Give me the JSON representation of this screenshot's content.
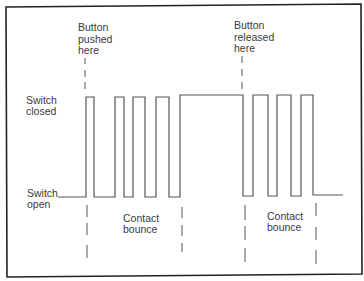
{
  "diagram": {
    "labels": {
      "button_pushed": [
        "Button",
        "pushed",
        "here"
      ],
      "button_released": [
        "Button",
        "released",
        "here"
      ],
      "switch_closed": [
        "Switch",
        "closed"
      ],
      "switch_open": [
        "Switch",
        "open"
      ],
      "contact_bounce_left": [
        "Contact",
        "bounce"
      ],
      "contact_bounce_right": [
        "Contact",
        "bounce"
      ]
    },
    "levels": {
      "high": "Switch closed",
      "low": "Switch open"
    },
    "signal_sequence": [
      {
        "state": "open",
        "phase": "before press"
      },
      {
        "state": "bouncing",
        "phase": "press contact bounce",
        "pulses": 4
      },
      {
        "state": "closed",
        "phase": "held"
      },
      {
        "state": "bouncing",
        "phase": "release contact bounce",
        "pulses": 3
      },
      {
        "state": "open",
        "phase": "after release"
      }
    ],
    "colors": {
      "frame": "#222222",
      "waveform": "#555555",
      "text": "#3a3a3a",
      "background": "#ffffff"
    }
  }
}
